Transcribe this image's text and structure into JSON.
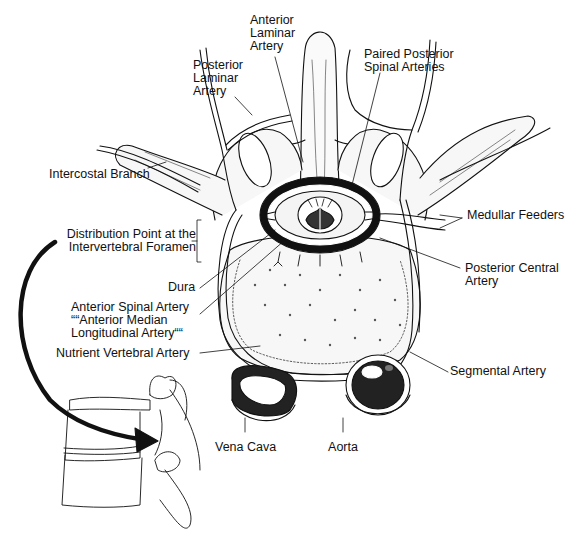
{
  "figure": {
    "labels": {
      "anterior_laminar_artery": [
        "Anterior",
        "Laminar",
        "Artery"
      ],
      "posterior_laminar_artery": [
        "Posterior",
        "Laminar",
        "Artery"
      ],
      "paired_posterior_spinal_arteries": [
        "Paired Posterior",
        "Spinal Arteries"
      ],
      "intercostal_branch": [
        "Intercostal Branch"
      ],
      "distribution_point": [
        "Distribution Point at the",
        "Intervertebral Foramen"
      ],
      "medullar_feeders": [
        "Medullar Feeders"
      ],
      "dura": [
        "Dura"
      ],
      "posterior_central_artery": [
        "Posterior Central",
        "Artery"
      ],
      "anterior_spinal_artery": [
        "Anterior Spinal Artery",
        "““Anterior Median",
        "Longitudinal Artery““"
      ],
      "nutrient_vertebral_artery": [
        "Nutrient Vertebral Artery"
      ],
      "segmental_artery": [
        "Segmental Artery"
      ],
      "vena_cava": [
        "Vena Cava"
      ],
      "aorta": [
        "Aorta"
      ]
    },
    "colors": {
      "ink": "#111111",
      "background": "#ffffff",
      "fill_light": "#f4f4f4"
    }
  }
}
